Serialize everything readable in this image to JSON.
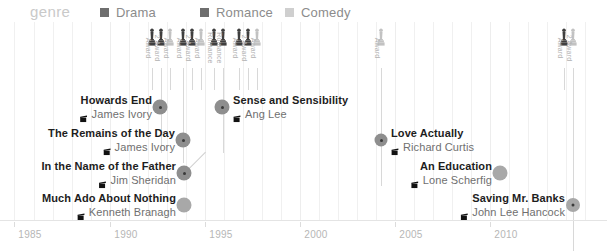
{
  "legend": {
    "title": "genre",
    "items": [
      {
        "label": "Drama",
        "color": "#6e6e6e",
        "x": 100
      },
      {
        "label": "Romance",
        "color": "#6e6e6e",
        "x": 200
      },
      {
        "label": "Comedy",
        "color": "#cfcfcf",
        "x": 285
      }
    ]
  },
  "chart_data": {
    "type": "scatter",
    "title": "",
    "xlabel": "",
    "ylabel": "",
    "xlim": [
      1985,
      2014
    ],
    "grid": true,
    "legend_position": "top",
    "tick_labels": [
      "1985",
      "1990",
      "1995",
      "2000",
      "2005",
      "2010"
    ],
    "tick_values": [
      1985,
      1990,
      1995,
      2000,
      2005,
      2010
    ],
    "series": [
      {
        "name": "Drama",
        "color": "#8e8e8e",
        "points": [
          {
            "title": "Howards End",
            "director": "James Ivory",
            "year": 1992
          },
          {
            "title": "The Remains of the Day",
            "director": "James Ivory",
            "year": 1993
          },
          {
            "title": "In the Name of the Father",
            "director": "Jim Sheridan",
            "year": 1993
          },
          {
            "title": "Sense and Sensibility",
            "director": "Ang Lee",
            "year": 1995
          },
          {
            "title": "Saving Mr. Banks",
            "director": "John Lee Hancock",
            "year": 2013
          }
        ]
      },
      {
        "name": "Romance",
        "color": "#8e8e8e",
        "points": [
          {
            "title": "Love Actually",
            "director": "Richard Curtis",
            "year": 2003
          }
        ]
      },
      {
        "name": "Comedy",
        "color": "#a8a8a8",
        "points": [
          {
            "title": "Much Ado About Nothing",
            "director": "Kenneth Branagh",
            "year": 1993
          },
          {
            "title": "An Education",
            "director": "Lone Scherfig",
            "year": 2009
          }
        ]
      }
    ],
    "films": [
      {
        "title": "Howards End",
        "director": "James Ivory",
        "year": 1992,
        "dot_x": 160,
        "dot_y": 107,
        "dot_size": 15,
        "dot_color": "#8e8e8e",
        "core": true,
        "align": "right",
        "label_x": 152,
        "label_y": 107
      },
      {
        "title": "Sense and Sensibility",
        "director": "Ang Lee",
        "year": 1995,
        "dot_x": 222,
        "dot_y": 107,
        "dot_size": 15,
        "dot_color": "#8e8e8e",
        "core": true,
        "align": "left",
        "label_x": 233,
        "label_y": 107
      },
      {
        "title": "The Remains of the Day",
        "director": "James Ivory",
        "year": 1993,
        "dot_x": 183,
        "dot_y": 140,
        "dot_size": 15,
        "dot_color": "#8e8e8e",
        "core": true,
        "align": "right",
        "label_x": 175,
        "label_y": 140
      },
      {
        "title": "Love Actually",
        "director": "Richard Curtis",
        "year": 2003,
        "dot_x": 381,
        "dot_y": 140,
        "dot_size": 13,
        "dot_color": "#8e8e8e",
        "core": true,
        "align": "left",
        "label_x": 391,
        "label_y": 140
      },
      {
        "title": "In the Name of the Father",
        "director": "Jim Sheridan",
        "year": 1993,
        "dot_x": 184,
        "dot_y": 173,
        "dot_size": 15,
        "dot_color": "#8e8e8e",
        "core": true,
        "align": "right",
        "label_x": 176,
        "label_y": 173
      },
      {
        "title": "An Education",
        "director": "Lone Scherfig",
        "year": 2009,
        "dot_x": 500,
        "dot_y": 173,
        "dot_size": 15,
        "dot_color": "#a8a8a8",
        "core": false,
        "align": "right",
        "label_x": 492,
        "label_y": 173
      },
      {
        "title": "Much Ado About Nothing",
        "director": "Kenneth Branagh",
        "year": 1993,
        "dot_x": 184,
        "dot_y": 205,
        "dot_size": 15,
        "dot_color": "#a8a8a8",
        "core": false,
        "align": "right",
        "label_x": 176,
        "label_y": 205
      },
      {
        "title": "Saving Mr. Banks",
        "director": "John Lee Hancock",
        "year": 2013,
        "dot_x": 573,
        "dot_y": 205,
        "dot_size": 14,
        "dot_color": "#a8a8a8",
        "core": true,
        "align": "right",
        "label_x": 565,
        "label_y": 205
      }
    ],
    "awards": [
      {
        "caption": "Award",
        "x": 152,
        "shade": "dark",
        "stem": 22
      },
      {
        "caption": "2 Award",
        "x": 161,
        "shade": "dark",
        "stem": 85
      },
      {
        "caption": "Award",
        "x": 170,
        "shade": "light",
        "stem": 22
      },
      {
        "caption": "Award",
        "x": 183,
        "shade": "dark",
        "stem": 95
      },
      {
        "caption": "2 Award",
        "x": 192,
        "shade": "dark",
        "stem": 22
      },
      {
        "caption": "Award",
        "x": 201,
        "shade": "light",
        "stem": 22
      },
      {
        "caption": "Romance",
        "x": 214,
        "shade": "dark",
        "stem": 22
      },
      {
        "caption": "Romance",
        "x": 223,
        "shade": "dark",
        "stem": 85
      },
      {
        "caption": "Award",
        "x": 239,
        "shade": "dark",
        "stem": 22
      },
      {
        "caption": "2 Award",
        "x": 248,
        "shade": "dark",
        "stem": 22
      },
      {
        "caption": "Award",
        "x": 257,
        "shade": "light",
        "stem": 22
      },
      {
        "caption": "Award",
        "x": 381,
        "shade": "light",
        "stem": 118
      },
      {
        "caption": "Award",
        "x": 564,
        "shade": "dark",
        "stem": 22
      },
      {
        "caption": "2 Award",
        "x": 573,
        "shade": "light",
        "stem": 183
      }
    ],
    "gridlines": [
      {
        "x": 14,
        "major": false
      },
      {
        "x": 34,
        "major": false
      },
      {
        "x": 53,
        "major": false
      },
      {
        "x": 72,
        "major": false
      },
      {
        "x": 91,
        "major": false
      },
      {
        "x": 110,
        "major": true
      },
      {
        "x": 129,
        "major": false
      },
      {
        "x": 148,
        "major": false
      },
      {
        "x": 167,
        "major": false
      },
      {
        "x": 186,
        "major": false
      },
      {
        "x": 205,
        "major": true
      },
      {
        "x": 224,
        "major": false
      },
      {
        "x": 243,
        "major": false
      },
      {
        "x": 262,
        "major": false
      },
      {
        "x": 281,
        "major": false
      },
      {
        "x": 300,
        "major": true
      },
      {
        "x": 319,
        "major": false
      },
      {
        "x": 338,
        "major": false
      },
      {
        "x": 357,
        "major": false
      },
      {
        "x": 376,
        "major": false
      },
      {
        "x": 395,
        "major": true
      },
      {
        "x": 414,
        "major": false
      },
      {
        "x": 433,
        "major": false
      },
      {
        "x": 452,
        "major": false
      },
      {
        "x": 471,
        "major": false
      },
      {
        "x": 490,
        "major": true
      },
      {
        "x": 509,
        "major": false
      },
      {
        "x": 528,
        "major": false
      },
      {
        "x": 547,
        "major": false
      },
      {
        "x": 566,
        "major": false
      },
      {
        "x": 585,
        "major": false
      }
    ],
    "tick_positions": [
      {
        "label": "1985",
        "x": 14
      },
      {
        "label": "1990",
        "x": 110
      },
      {
        "label": "1995",
        "x": 205
      },
      {
        "label": "2000",
        "x": 300
      },
      {
        "label": "2005",
        "x": 395
      },
      {
        "label": "2010",
        "x": 490
      }
    ],
    "leaders": [
      {
        "type": "diagonal",
        "x1": 184,
        "y1": 173,
        "x2": 205,
        "y2": 152
      }
    ]
  }
}
